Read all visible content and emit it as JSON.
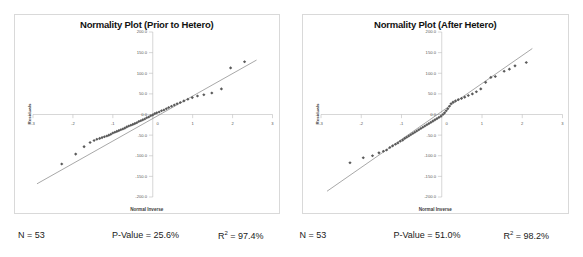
{
  "figure": {
    "background": "#ffffff",
    "panel_count": 2
  },
  "panels": [
    {
      "id": "prior",
      "title": "Normality Plot (Prior to Hetero)",
      "xlabel": "Normal Inverse",
      "ylabel": "Residuals",
      "stats": {
        "n_label": "N = 53",
        "p_label": "P-Value = 25.6%",
        "r2_base": "R",
        "r2_exp": "2",
        "r2_value": " = 97.4%"
      }
    },
    {
      "id": "after",
      "title": "Normality Plot (After Hetero)",
      "xlabel": "Normal Inverse",
      "ylabel": "Residuals",
      "stats": {
        "n_label": "N = 53",
        "p_label": "P-Value = 51.0%",
        "r2_base": "R",
        "r2_exp": "2",
        "r2_value": " = 98.2%"
      }
    }
  ],
  "chart_data": [
    {
      "type": "scatter",
      "title": "Normality Plot (Prior to Hetero)",
      "xlabel": "Normal Inverse",
      "ylabel": "Residuals",
      "xlim": [
        -3,
        3
      ],
      "ylim": [
        -200,
        200
      ],
      "xticks": [
        -3,
        -2,
        -1,
        0,
        1,
        2,
        3
      ],
      "xticklabels": [
        "-3",
        "-2",
        "-1",
        "0",
        "1",
        "2",
        "3"
      ],
      "yticks": [
        200,
        150,
        100,
        50,
        0,
        -50,
        -100,
        -150,
        -200
      ],
      "yticklabels": [
        "200.0",
        "150.0",
        "100.0",
        "50.0",
        "0.0",
        "-50.0",
        "-100.0",
        "-150.0",
        "-200.0"
      ],
      "grid": false,
      "legend": "none",
      "marker_color": "#5a5a5a",
      "line_color": "#7a7a7a",
      "n": 53,
      "p_value_percent": 25.6,
      "r_squared_percent": 97.4,
      "fit_line": {
        "x": [
          -2.9,
          2.6
        ],
        "y": [
          -168,
          132
        ]
      },
      "points": [
        {
          "x": -2.28,
          "y": -120
        },
        {
          "x": -1.93,
          "y": -96
        },
        {
          "x": -1.72,
          "y": -78
        },
        {
          "x": -1.57,
          "y": -68
        },
        {
          "x": -1.47,
          "y": -63
        },
        {
          "x": -1.4,
          "y": -60
        },
        {
          "x": -1.33,
          "y": -58
        },
        {
          "x": -1.27,
          "y": -56
        },
        {
          "x": -1.21,
          "y": -54
        },
        {
          "x": -1.15,
          "y": -52
        },
        {
          "x": -1.1,
          "y": -50
        },
        {
          "x": -1.05,
          "y": -48
        },
        {
          "x": -1.0,
          "y": -45
        },
        {
          "x": -0.95,
          "y": -43
        },
        {
          "x": -0.9,
          "y": -41
        },
        {
          "x": -0.85,
          "y": -39
        },
        {
          "x": -0.8,
          "y": -37
        },
        {
          "x": -0.75,
          "y": -35
        },
        {
          "x": -0.7,
          "y": -33
        },
        {
          "x": -0.65,
          "y": -30
        },
        {
          "x": -0.6,
          "y": -28
        },
        {
          "x": -0.55,
          "y": -26
        },
        {
          "x": -0.5,
          "y": -24
        },
        {
          "x": -0.45,
          "y": -22
        },
        {
          "x": -0.4,
          "y": -20
        },
        {
          "x": -0.35,
          "y": -17
        },
        {
          "x": -0.3,
          "y": -15
        },
        {
          "x": -0.25,
          "y": -13
        },
        {
          "x": -0.2,
          "y": -11
        },
        {
          "x": -0.15,
          "y": -8
        },
        {
          "x": -0.1,
          "y": -6
        },
        {
          "x": -0.05,
          "y": -3
        },
        {
          "x": 0.0,
          "y": -1
        },
        {
          "x": 0.05,
          "y": 2
        },
        {
          "x": 0.1,
          "y": 4
        },
        {
          "x": 0.16,
          "y": 6
        },
        {
          "x": 0.22,
          "y": 9
        },
        {
          "x": 0.28,
          "y": 11
        },
        {
          "x": 0.34,
          "y": 14
        },
        {
          "x": 0.4,
          "y": 17
        },
        {
          "x": 0.47,
          "y": 20
        },
        {
          "x": 0.54,
          "y": 23
        },
        {
          "x": 0.61,
          "y": 26
        },
        {
          "x": 0.69,
          "y": 29
        },
        {
          "x": 0.78,
          "y": 33
        },
        {
          "x": 0.88,
          "y": 37
        },
        {
          "x": 0.99,
          "y": 41
        },
        {
          "x": 1.12,
          "y": 45
        },
        {
          "x": 1.28,
          "y": 48
        },
        {
          "x": 1.48,
          "y": 52
        },
        {
          "x": 1.72,
          "y": 62
        },
        {
          "x": 1.95,
          "y": 113
        },
        {
          "x": 2.3,
          "y": 128
        }
      ]
    },
    {
      "type": "scatter",
      "title": "Normality Plot (After Hetero)",
      "xlabel": "Normal Inverse",
      "ylabel": "Residuals",
      "xlim": [
        -3,
        3
      ],
      "ylim": [
        -200,
        200
      ],
      "xticks": [
        -3,
        -2,
        -1,
        0,
        1,
        2,
        3
      ],
      "xticklabels": [
        "-3",
        "-2",
        "-1",
        "0",
        "1",
        "2",
        "3"
      ],
      "yticks": [
        200,
        150,
        100,
        50,
        0,
        -50,
        -100,
        -150,
        -200
      ],
      "yticklabels": [
        "200.0",
        "150.0",
        "100.0",
        "50.0",
        "0.0",
        "-50.0",
        "-100.0",
        "-150.0",
        "-200.0"
      ],
      "grid": false,
      "legend": "none",
      "marker_color": "#5a5a5a",
      "line_color": "#7a7a7a",
      "n": 53,
      "p_value_percent": 51.0,
      "r_squared_percent": 98.2,
      "fit_line": {
        "x": [
          -2.85,
          2.25
        ],
        "y": [
          -186,
          160
        ]
      },
      "points": [
        {
          "x": -2.28,
          "y": -117
        },
        {
          "x": -1.95,
          "y": -105
        },
        {
          "x": -1.72,
          "y": -100
        },
        {
          "x": -1.56,
          "y": -93
        },
        {
          "x": -1.45,
          "y": -89
        },
        {
          "x": -1.37,
          "y": -86
        },
        {
          "x": -1.29,
          "y": -80
        },
        {
          "x": -1.22,
          "y": -76
        },
        {
          "x": -1.15,
          "y": -72
        },
        {
          "x": -1.09,
          "y": -69
        },
        {
          "x": -1.03,
          "y": -65
        },
        {
          "x": -0.97,
          "y": -62
        },
        {
          "x": -0.92,
          "y": -58
        },
        {
          "x": -0.87,
          "y": -55
        },
        {
          "x": -0.82,
          "y": -52
        },
        {
          "x": -0.77,
          "y": -49
        },
        {
          "x": -0.72,
          "y": -46
        },
        {
          "x": -0.67,
          "y": -43
        },
        {
          "x": -0.62,
          "y": -40
        },
        {
          "x": -0.57,
          "y": -37
        },
        {
          "x": -0.52,
          "y": -34
        },
        {
          "x": -0.47,
          "y": -31
        },
        {
          "x": -0.42,
          "y": -28
        },
        {
          "x": -0.37,
          "y": -25
        },
        {
          "x": -0.32,
          "y": -22
        },
        {
          "x": -0.27,
          "y": -19
        },
        {
          "x": -0.22,
          "y": -16
        },
        {
          "x": -0.17,
          "y": -13
        },
        {
          "x": -0.12,
          "y": -10
        },
        {
          "x": -0.07,
          "y": -7
        },
        {
          "x": -0.02,
          "y": -4
        },
        {
          "x": 0.03,
          "y": 0
        },
        {
          "x": 0.07,
          "y": 4
        },
        {
          "x": 0.11,
          "y": 9
        },
        {
          "x": 0.15,
          "y": 14
        },
        {
          "x": 0.19,
          "y": 20
        },
        {
          "x": 0.23,
          "y": 26
        },
        {
          "x": 0.28,
          "y": 30
        },
        {
          "x": 0.34,
          "y": 33
        },
        {
          "x": 0.41,
          "y": 36
        },
        {
          "x": 0.49,
          "y": 39
        },
        {
          "x": 0.57,
          "y": 42
        },
        {
          "x": 0.66,
          "y": 46
        },
        {
          "x": 0.76,
          "y": 50
        },
        {
          "x": 0.86,
          "y": 55
        },
        {
          "x": 0.97,
          "y": 62
        },
        {
          "x": 1.09,
          "y": 78
        },
        {
          "x": 1.22,
          "y": 90
        },
        {
          "x": 1.33,
          "y": 92
        },
        {
          "x": 1.55,
          "y": 105
        },
        {
          "x": 1.68,
          "y": 110
        },
        {
          "x": 1.82,
          "y": 118
        },
        {
          "x": 2.1,
          "y": 126
        }
      ]
    }
  ]
}
